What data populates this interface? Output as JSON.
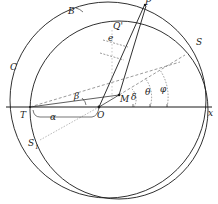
{
  "diagram": {
    "type": "geometric-construction",
    "stroke_color": "#1a1a1a",
    "dash_color": "#555555",
    "labels": {
      "B": "B",
      "C": "C",
      "S": "S",
      "Q_prime": "Q'",
      "e": "e",
      "beta": "β",
      "alpha": "α",
      "delta": "δ",
      "theta": "θ",
      "phi": "φ",
      "M": "M",
      "O": "O",
      "T": "T",
      "x": "x",
      "S1": "S",
      "S1_sub": "1",
      "P": "P"
    },
    "elements": {
      "outer_circle": {
        "label": "C / S",
        "center": [
          108,
          100
        ],
        "radius": 98
      },
      "inner_circle": {
        "center": [
          119,
          110
        ],
        "radius": 89
      },
      "x_axis": {
        "from": [
          6,
          107
        ],
        "to": [
          212,
          107
        ]
      },
      "points": {
        "O": [
          99,
          107
        ],
        "T": [
          30,
          107
        ],
        "M": [
          119,
          95
        ],
        "P": [
          145,
          4
        ]
      }
    }
  }
}
